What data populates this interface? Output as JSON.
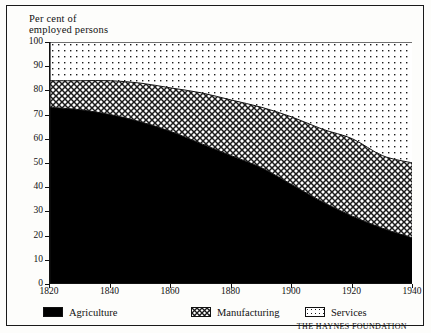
{
  "figure": {
    "axis_title": "Per cent of\nemployed persons",
    "credit": "THE HAYNES FOUNDATION"
  },
  "legend": {
    "items": [
      {
        "label": "Agriculture",
        "pattern": "solid-black",
        "color": "#000000"
      },
      {
        "label": "Manufacturing",
        "pattern": "cross-hatch",
        "color": "#000000"
      },
      {
        "label": "Services",
        "pattern": "fine-dots",
        "color": "#000000"
      }
    ]
  },
  "chart_data": {
    "type": "area",
    "stacked": true,
    "title": "",
    "subtitle": "",
    "xlabel": "",
    "ylabel": "Per cent of employed persons",
    "xlim": [
      1820,
      1940
    ],
    "ylim": [
      0,
      100
    ],
    "grid": false,
    "legend_position": "bottom",
    "xticks": [
      1820,
      1840,
      1860,
      1880,
      1900,
      1920,
      1940
    ],
    "yticks": [
      0,
      10,
      20,
      30,
      40,
      50,
      60,
      70,
      80,
      90,
      100
    ],
    "x": [
      1820,
      1830,
      1840,
      1850,
      1860,
      1870,
      1880,
      1890,
      1900,
      1910,
      1920,
      1930,
      1940
    ],
    "series": [
      {
        "name": "Agriculture",
        "pattern": "solid-black",
        "values": [
          73,
          72,
          70,
          67,
          63,
          58,
          53,
          48,
          41,
          34,
          28,
          23,
          19
        ]
      },
      {
        "name": "Manufacturing",
        "pattern": "cross-hatch",
        "values": [
          11,
          12,
          14,
          16,
          18,
          21,
          23,
          25,
          28,
          30,
          32,
          30,
          31
        ]
      },
      {
        "name": "Services",
        "pattern": "fine-dots",
        "values": [
          16,
          16,
          16,
          17,
          19,
          21,
          24,
          27,
          31,
          36,
          40,
          47,
          50
        ]
      }
    ],
    "cumulative_upper_bounds": {
      "agriculture": [
        73,
        72,
        70,
        67,
        63,
        58,
        53,
        48,
        41,
        34,
        28,
        23,
        19
      ],
      "agriculture_plus_manufacturing": [
        84,
        84,
        84,
        83,
        81,
        79,
        76,
        73,
        69,
        64,
        60,
        53,
        50
      ]
    }
  }
}
